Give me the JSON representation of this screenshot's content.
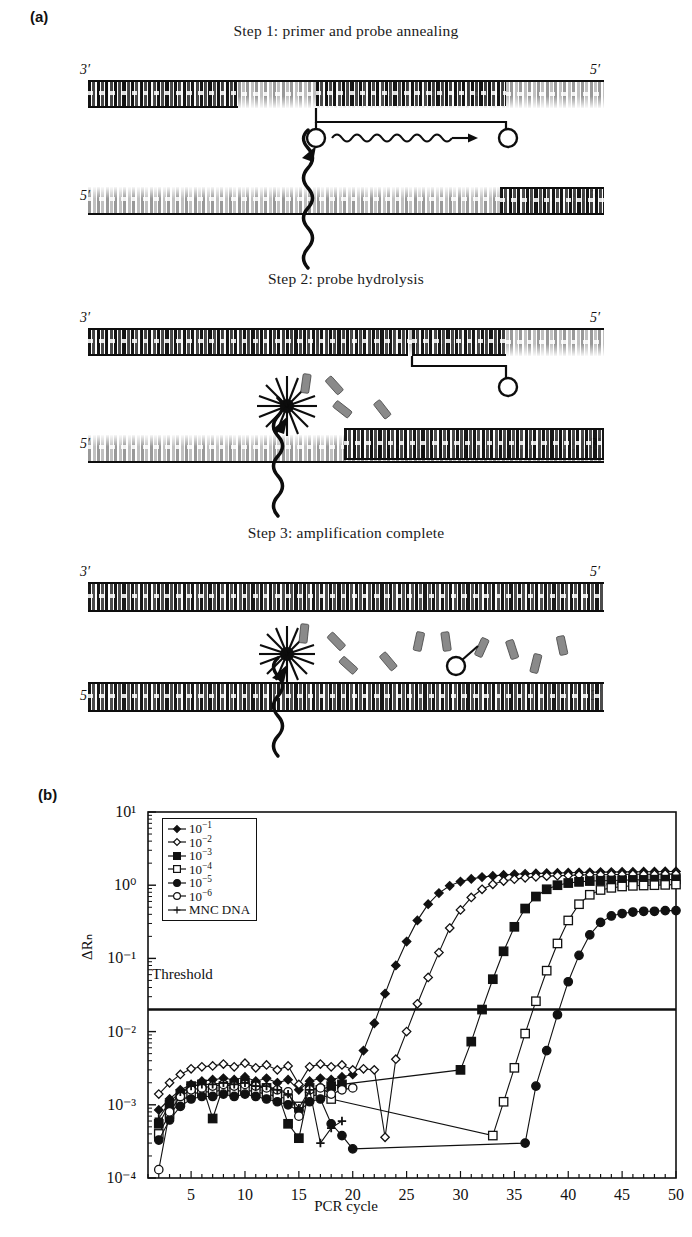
{
  "panels": {
    "a_label": "(a)",
    "b_label": "(b)"
  },
  "steps": [
    {
      "title": "Step 1: primer and probe annealing",
      "left_top_label": "3′",
      "right_top_label": "5′",
      "left_bottom_label": "5′",
      "right_bottom_label": "3′"
    },
    {
      "title": "Step 2: probe hydrolysis",
      "left_top_label": "3′",
      "right_top_label": "5′",
      "left_bottom_label": "5′",
      "right_bottom_label": "3′"
    },
    {
      "title": "Step 3: amplification complete",
      "left_top_label": "3′",
      "right_top_label": "5′",
      "left_bottom_label": "5′",
      "right_bottom_label": "3′"
    }
  ],
  "chart_data": {
    "type": "line",
    "title": "",
    "xlabel": "PCR cycle",
    "ylabel": "ΔRₙ",
    "yscale": "log",
    "xlim": [
      1,
      50
    ],
    "ylim": [
      0.0001,
      10
    ],
    "grid": false,
    "legend_position": "top-left-inside",
    "x_ticks": [
      5,
      10,
      15,
      20,
      25,
      30,
      35,
      40,
      45,
      50
    ],
    "x_tick_labels": [
      "5",
      "10",
      "15",
      "20",
      "25",
      "30",
      "35",
      "40",
      "45",
      "50"
    ],
    "x_minor_tick_step": 1,
    "y_ticks": [
      0.0001,
      0.001,
      0.01,
      0.1,
      1,
      10
    ],
    "y_tick_labels": [
      "10⁻⁴",
      "10⁻³",
      "10⁻²",
      "10⁻¹",
      "10⁰",
      "10¹"
    ],
    "annotations": [
      {
        "text": "Threshold",
        "y": 0.02,
        "type": "hline"
      }
    ],
    "threshold_value": 0.02,
    "series": [
      {
        "name": "10⁻¹",
        "label_base": "10",
        "label_exp": "−1",
        "marker": "filled-diamond",
        "ct": 21.5,
        "plateau": 1.55,
        "x": [
          2,
          3,
          4,
          5,
          6,
          7,
          8,
          9,
          10,
          11,
          12,
          13,
          14,
          15,
          16,
          17,
          18,
          19,
          20,
          21,
          22,
          23,
          24,
          25,
          26,
          27,
          28,
          29,
          30,
          31,
          32,
          33,
          34,
          35,
          36,
          37,
          38,
          39,
          40,
          41,
          42,
          43,
          44,
          45,
          46,
          47,
          48,
          49,
          50
        ],
        "y": [
          0.00085,
          0.0012,
          0.0016,
          0.0019,
          0.0021,
          0.0022,
          0.0023,
          0.0022,
          0.0024,
          0.0021,
          0.0023,
          0.002,
          0.0022,
          0.0016,
          0.0021,
          0.0023,
          0.0022,
          0.0024,
          0.0026,
          0.0055,
          0.013,
          0.033,
          0.08,
          0.17,
          0.33,
          0.55,
          0.78,
          0.98,
          1.12,
          1.22,
          1.29,
          1.34,
          1.38,
          1.41,
          1.43,
          1.45,
          1.46,
          1.47,
          1.48,
          1.49,
          1.5,
          1.51,
          1.51,
          1.52,
          1.52,
          1.53,
          1.53,
          1.54,
          1.54
        ]
      },
      {
        "name": "10⁻²",
        "label_base": "10",
        "label_exp": "−2",
        "marker": "open-diamond",
        "ct": 24.5,
        "plateau": 1.42,
        "x": [
          2,
          3,
          4,
          5,
          6,
          7,
          8,
          9,
          10,
          11,
          12,
          13,
          14,
          15,
          16,
          17,
          18,
          19,
          20,
          21,
          22,
          23,
          24,
          25,
          26,
          27,
          28,
          29,
          30,
          31,
          32,
          33,
          34,
          35,
          36,
          37,
          38,
          39,
          40,
          41,
          42,
          43,
          44,
          45,
          46,
          47,
          48,
          49,
          50
        ],
        "y": [
          0.0014,
          0.002,
          0.0026,
          0.0031,
          0.0033,
          0.0034,
          0.0036,
          0.0033,
          0.0037,
          0.0032,
          0.0035,
          0.003,
          0.0034,
          0.0019,
          0.0033,
          0.0036,
          0.0033,
          0.0035,
          0.003,
          0.0031,
          0.003,
          0.00036,
          0.0042,
          0.01,
          0.024,
          0.055,
          0.12,
          0.26,
          0.46,
          0.68,
          0.88,
          1.03,
          1.14,
          1.21,
          1.26,
          1.3,
          1.33,
          1.35,
          1.36,
          1.38,
          1.39,
          1.39,
          1.4,
          1.4,
          1.41,
          1.41,
          1.41,
          1.42,
          1.42
        ]
      },
      {
        "name": "10⁻³",
        "label_base": "10",
        "label_exp": "−3",
        "marker": "filled-square",
        "ct": 28.0,
        "plateau": 1.2,
        "x": [
          2,
          3,
          4,
          5,
          6,
          7,
          8,
          9,
          10,
          11,
          12,
          13,
          14,
          15,
          16,
          17,
          18,
          19,
          30,
          31,
          32,
          33,
          34,
          35,
          36,
          37,
          38,
          39,
          40,
          41,
          42,
          43,
          44,
          45,
          46,
          47,
          48,
          49,
          50
        ],
        "y": [
          0.00055,
          0.001,
          0.0014,
          0.0018,
          0.0019,
          0.00065,
          0.0018,
          0.0019,
          0.002,
          0.0018,
          0.0017,
          0.0015,
          0.00055,
          0.00035,
          0.0017,
          0.0016,
          0.0018,
          0.0019,
          0.003,
          0.0073,
          0.02,
          0.052,
          0.125,
          0.27,
          0.48,
          0.7,
          0.88,
          1.0,
          1.07,
          1.11,
          1.14,
          1.15,
          1.16,
          1.17,
          1.18,
          1.18,
          1.19,
          1.19,
          1.2
        ]
      },
      {
        "name": "10⁻⁴",
        "label_base": "10",
        "label_exp": "−4",
        "marker": "open-square",
        "ct": 31.5,
        "plateau": 1.02,
        "x": [
          2,
          3,
          4,
          5,
          6,
          7,
          8,
          9,
          10,
          11,
          12,
          13,
          14,
          15,
          16,
          17,
          18,
          33,
          34,
          35,
          36,
          37,
          38,
          39,
          40,
          41,
          42,
          43,
          44,
          45,
          46,
          47,
          48,
          49,
          50
        ],
        "y": [
          0.0004,
          0.00075,
          0.0011,
          0.0014,
          0.0015,
          0.0015,
          0.0016,
          0.0015,
          0.0016,
          0.0015,
          0.0014,
          0.0013,
          0.0012,
          0.00095,
          0.0013,
          0.0014,
          0.0012,
          0.00038,
          0.0011,
          0.0032,
          0.0094,
          0.026,
          0.068,
          0.16,
          0.33,
          0.55,
          0.74,
          0.86,
          0.92,
          0.96,
          0.98,
          0.99,
          1.0,
          1.01,
          1.02
        ]
      },
      {
        "name": "10⁻⁵",
        "label_base": "10",
        "label_exp": "−5",
        "marker": "filled-circle",
        "ct": 35.0,
        "plateau": 0.45,
        "x": [
          2,
          3,
          4,
          5,
          6,
          7,
          8,
          9,
          10,
          11,
          12,
          13,
          14,
          15,
          16,
          17,
          18,
          19,
          20,
          36,
          37,
          38,
          39,
          40,
          41,
          42,
          43,
          44,
          45,
          46,
          47,
          48,
          49,
          50
        ],
        "y": [
          0.00033,
          0.00062,
          0.00095,
          0.0012,
          0.0013,
          0.0013,
          0.0014,
          0.0013,
          0.0014,
          0.0013,
          0.0012,
          0.0011,
          0.001,
          0.00082,
          0.0011,
          0.0012,
          0.00055,
          0.00038,
          0.00025,
          0.0003,
          0.0018,
          0.0055,
          0.017,
          0.048,
          0.11,
          0.21,
          0.31,
          0.38,
          0.41,
          0.43,
          0.44,
          0.44,
          0.45,
          0.45
        ]
      },
      {
        "name": "10⁻⁶",
        "label_base": "10",
        "label_exp": "−6",
        "marker": "open-circle",
        "ct": null,
        "plateau": null,
        "x": [
          2,
          3,
          4,
          5,
          6,
          7,
          8,
          9,
          10,
          11,
          12,
          13,
          14,
          15,
          16,
          17,
          18,
          19,
          20
        ],
        "y": [
          0.00013,
          0.0008,
          0.0013,
          0.0016,
          0.0017,
          0.0018,
          0.0019,
          0.0018,
          0.0019,
          0.0018,
          0.0017,
          0.0016,
          0.0015,
          0.0007,
          0.0016,
          0.0017,
          0.0014,
          0.0016,
          0.0017
        ]
      },
      {
        "name": "MNC DNA",
        "label_base": "MNC DNA",
        "label_exp": "",
        "marker": "plus",
        "ct": null,
        "plateau": null,
        "x": [
          2,
          3,
          4,
          5,
          6,
          7,
          8,
          9,
          10,
          11,
          12,
          13,
          14,
          15,
          16,
          17,
          18,
          19
        ],
        "y": [
          0.00065,
          0.0011,
          0.0015,
          0.0018,
          0.0019,
          0.0019,
          0.002,
          0.0019,
          0.002,
          0.0018,
          0.0018,
          0.0016,
          0.0014,
          0.0009,
          0.0016,
          0.0003,
          0.00048,
          0.0006
        ]
      }
    ]
  }
}
